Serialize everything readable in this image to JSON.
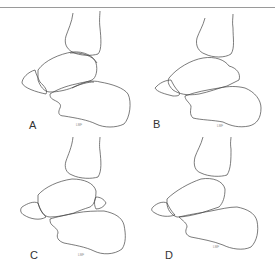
{
  "figure": {
    "panels": [
      {
        "id": "A",
        "label": "A",
        "signature": "LMF"
      },
      {
        "id": "B",
        "label": "B",
        "signature": "LMF"
      },
      {
        "id": "C",
        "label": "C",
        "signature": "LMF"
      },
      {
        "id": "D",
        "label": "D",
        "signature": "LMF"
      }
    ],
    "colors": {
      "line": "#444444",
      "rule": "#9a9a9a",
      "background": "#ffffff"
    }
  }
}
